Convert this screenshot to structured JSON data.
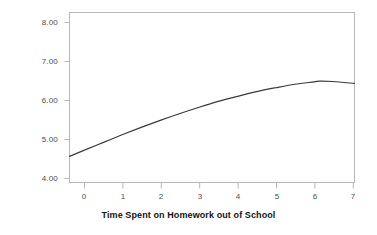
{
  "chart_data": {
    "type": "line",
    "title": "",
    "xlabel": "Time Spent on Homework out of School",
    "ylabel": "10th-Grade GPA",
    "xlim": [
      -0.39,
      7.06
    ],
    "ylim": [
      3.84,
      8.2
    ],
    "grid": false,
    "legend": null,
    "xticks": [
      0,
      1,
      2,
      3,
      4,
      5,
      6,
      7
    ],
    "xtick_labels": [
      "0",
      "1",
      "2",
      "3",
      "4",
      "5",
      "6",
      "7"
    ],
    "yticks": [
      4.0,
      5.0,
      6.0,
      7.0,
      8.0
    ],
    "ytick_labels": [
      "4.00",
      "5.00",
      "6.00",
      "7.00",
      "8.00"
    ],
    "series": [
      {
        "name": "Predicted 10th-Grade GPA",
        "x": [
          -0.39,
          0.0,
          0.5,
          1.0,
          1.5,
          2.0,
          2.5,
          3.0,
          3.5,
          4.0,
          4.5,
          5.0,
          5.5,
          6.0,
          6.15,
          6.5,
          7.06
        ],
        "y": [
          4.51,
          4.67,
          4.87,
          5.07,
          5.26,
          5.44,
          5.61,
          5.77,
          5.92,
          6.05,
          6.17,
          6.27,
          6.36,
          6.42,
          6.44,
          6.43,
          6.38
        ],
        "color": "#3a3a3a",
        "line_width": 1.2,
        "marker": "none"
      }
    ],
    "annotations": []
  },
  "axes": {
    "frame_color": "#b8b8b8",
    "tick_color": "#b8b8b8",
    "tick_label_color": "#4d4d4d",
    "axis_title_color": "#141414",
    "background": "#ffffff"
  }
}
